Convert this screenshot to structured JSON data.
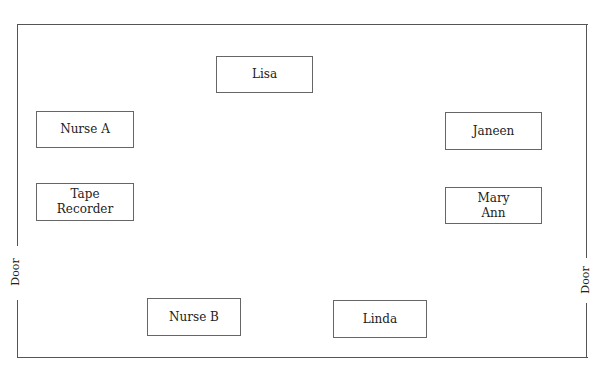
{
  "diagram": {
    "type": "room-seating-layout",
    "walls": {
      "left_door_label": "Door",
      "right_door_label": "Door"
    },
    "positions": [
      {
        "id": "lisa",
        "label": "Lisa"
      },
      {
        "id": "nurse-a",
        "label": "Nurse A"
      },
      {
        "id": "tape-recorder",
        "label": "Tape\nRecorder"
      },
      {
        "id": "janeen",
        "label": "Janeen"
      },
      {
        "id": "mary-ann",
        "label": "Mary\nAnn"
      },
      {
        "id": "nurse-b",
        "label": "Nurse B"
      },
      {
        "id": "linda",
        "label": "Linda"
      }
    ]
  }
}
